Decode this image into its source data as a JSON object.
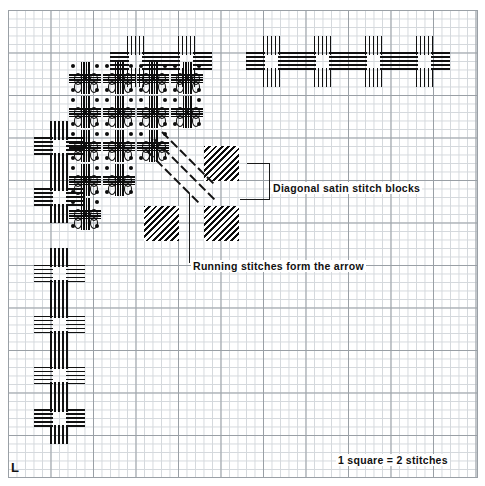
{
  "chart": {
    "kind": "embroidery-pattern-chart",
    "corner_marker": "L",
    "scale_note": "1 square = 2 stitches",
    "annotations": [
      {
        "id": "satin",
        "text": "Diagonal satin stitch blocks"
      },
      {
        "id": "running",
        "text": "Running stitches form the arrow"
      }
    ],
    "colors": {
      "stitch": "#111111",
      "grid_minor": "#d4d8dc",
      "grid_major": "#9aa0a6",
      "paper": "#ffffff"
    },
    "grid": {
      "cell_px": 8.5,
      "major_every": 5,
      "cols": 55,
      "rows": 55
    }
  },
  "chart_data": {
    "type": "scatter",
    "xlabel": "",
    "ylabel": "",
    "legend_position": "none",
    "grid": true,
    "xlim": [
      0,
      55
    ],
    "ylim": [
      0,
      55
    ],
    "annotations": [
      "Diagonal satin stitch blocks",
      "Running stitches form the arrow",
      "1 square = 2 stitches",
      "L"
    ],
    "series": [
      {
        "name": "cross-motifs",
        "marker": "cross-of-parallel-stitch-lines",
        "points": [
          [
            31,
            6
          ],
          [
            37,
            6
          ],
          [
            43,
            6
          ],
          [
            49,
            6
          ],
          [
            21,
            6
          ],
          [
            15,
            6
          ],
          [
            6,
            16
          ],
          [
            6,
            22
          ],
          [
            6,
            31
          ],
          [
            6,
            37
          ],
          [
            6,
            43
          ],
          [
            6,
            48
          ]
        ]
      },
      {
        "name": "knot-texture-cluster",
        "marker": "knot",
        "points": [
          [
            9,
            8
          ],
          [
            13,
            8
          ],
          [
            17,
            8
          ],
          [
            21,
            8
          ],
          [
            9,
            12
          ],
          [
            13,
            12
          ],
          [
            17,
            12
          ],
          [
            21,
            12
          ],
          [
            9,
            16
          ],
          [
            13,
            16
          ],
          [
            17,
            16
          ],
          [
            9,
            20
          ],
          [
            13,
            20
          ],
          [
            9,
            24
          ]
        ]
      },
      {
        "name": "satin-stitch-blocks",
        "marker": "diagonal-hatch-square",
        "points": [
          [
            25,
            18
          ],
          [
            25,
            25
          ],
          [
            18,
            25
          ]
        ]
      },
      {
        "name": "running-stitch-arrow",
        "marker": "diagonal-dash",
        "points": [
          [
            18,
            17
          ],
          [
            20,
            19
          ],
          [
            22,
            21
          ],
          [
            24,
            23
          ],
          [
            19,
            16
          ],
          [
            21,
            18
          ],
          [
            23,
            20
          ]
        ]
      }
    ]
  }
}
